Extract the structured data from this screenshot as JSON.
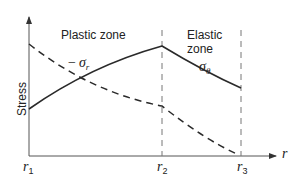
{
  "diagram": {
    "axes": {
      "y_label": "Stress",
      "x_label": "r",
      "x_ticks": [
        {
          "base": "r",
          "sub": "1"
        },
        {
          "base": "r",
          "sub": "2"
        },
        {
          "base": "r",
          "sub": "3"
        }
      ]
    },
    "zones": {
      "plastic": "Plastic zone",
      "elastic_line1": "Elastic",
      "elastic_line2": "zone"
    },
    "curves": {
      "sigma_theta": {
        "base": "σ",
        "sub": "θ",
        "style": "solid"
      },
      "neg_sigma_r": {
        "prefix": "−",
        "base": "σ",
        "sub": "r",
        "style": "dashed"
      }
    },
    "colors": {
      "line": "#2a2a2a",
      "axis": "#555555",
      "guide": "#777777"
    }
  }
}
